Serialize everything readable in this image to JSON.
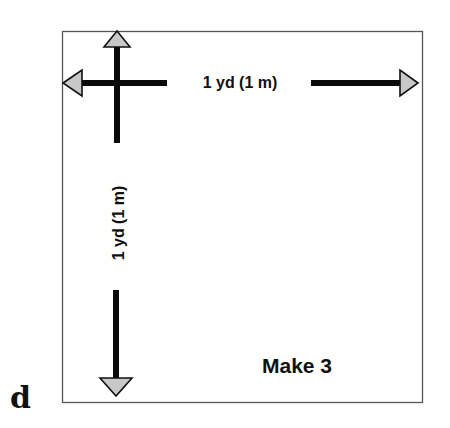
{
  "figure": {
    "panel_letter": "d",
    "width_label": "1 yd (1 m)",
    "height_label": "1 yd (1 m)",
    "quantity_note": "Make 3"
  },
  "colors": {
    "frame": "#555555",
    "arrow_shaft": "#0a0a0a",
    "arrowhead_fill": "#c8c8c8",
    "arrowhead_stroke": "#111111",
    "text": "#111111",
    "background": "#ffffff"
  }
}
